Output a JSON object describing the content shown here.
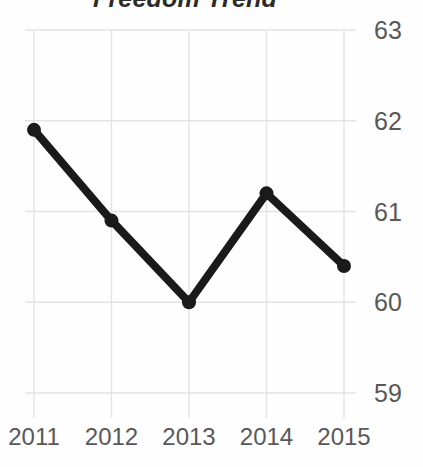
{
  "chart_data": {
    "type": "line",
    "title": "Freedom Trend",
    "xlabel": "",
    "ylabel": "",
    "categories": [
      "2011",
      "2012",
      "2013",
      "2014",
      "2015"
    ],
    "values": [
      61.9,
      60.9,
      60.0,
      61.2,
      60.4
    ],
    "series": [
      {
        "name": "Freedom",
        "values": [
          61.9,
          60.9,
          60.0,
          61.2,
          60.4
        ]
      }
    ],
    "ylim": [
      59,
      63
    ],
    "yticks": [
      63,
      62,
      61,
      60,
      59
    ],
    "ytick_labels": [
      "63",
      "62",
      "61",
      "60",
      "59"
    ],
    "xtick_labels": [
      "2011",
      "2012",
      "2013",
      "2014",
      "2015"
    ],
    "grid": true,
    "legend": false,
    "legend_position": "none",
    "markers": "circle",
    "colors": {
      "line": "#1a1a1a",
      "marker": "#1a1a1a",
      "grid": "#e3e3e5",
      "tick_label": "#58585a",
      "title": "#2b2b2b",
      "background": "#fefefe"
    }
  }
}
